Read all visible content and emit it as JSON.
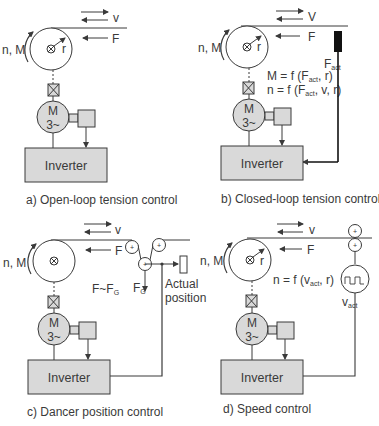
{
  "figure": {
    "panels": [
      {
        "id": "a",
        "caption": "a) Open-loop tension control",
        "labels": {
          "speed": "v",
          "force": "F",
          "radius": "r",
          "rotation": "n, M",
          "motor_top": "M",
          "motor_bottom": "3~",
          "inverter": "Inverter"
        }
      },
      {
        "id": "b",
        "caption": "b) Closed-loop tension control",
        "labels": {
          "speed": "V",
          "force": "F",
          "radius": "r",
          "rotation": "n, M",
          "motor_top": "M",
          "motor_bottom": "3~",
          "inverter": "Inverter",
          "sensor": "F",
          "sensor_sub": "act",
          "eq1_pre": "M = f (F",
          "eq1_sub": "act",
          "eq1_post": ", r)",
          "eq2_pre": "n = f (F",
          "eq2_sub": "act",
          "eq2_post": ", v, r)"
        }
      },
      {
        "id": "c",
        "caption": "c) Dancer position control",
        "labels": {
          "speed": "v",
          "force": "F",
          "rotation": "n, M",
          "motor_top": "M",
          "motor_bottom": "3~",
          "inverter": "Inverter",
          "relation_pre": "F~F",
          "relation_sub": "G",
          "dancer_force": "F",
          "dancer_force_sub": "G",
          "actual_1": "Actual",
          "actual_2": "position"
        }
      },
      {
        "id": "d",
        "caption": "d) Speed control",
        "labels": {
          "speed": "v",
          "force": "F",
          "radius": "r",
          "rotation": "n, M",
          "motor_top": "M",
          "motor_bottom": "3~",
          "inverter": "Inverter",
          "eq_pre": "n = f (v",
          "eq_sub": "act",
          "eq_post": ", r)",
          "tach": "v",
          "tach_sub": "act"
        }
      }
    ],
    "colors": {
      "line": "#3a3a3a",
      "fill_gray": "#d9d9d9",
      "sensor_black": "#111111",
      "background": "#ffffff"
    }
  }
}
